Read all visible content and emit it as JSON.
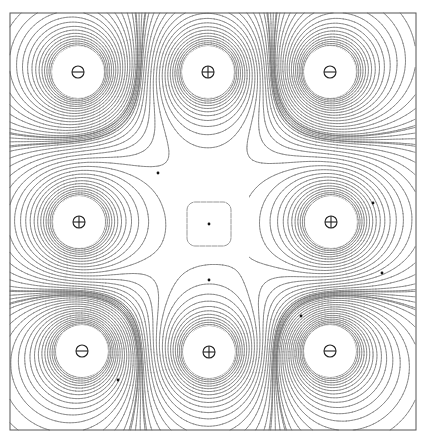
{
  "figure": {
    "type": "equipotential-contour-plot",
    "frame": {
      "x0": 10,
      "y0": 13,
      "x1": 416,
      "y1": 430
    },
    "charges": [
      {
        "id": "q1",
        "sign": "negative",
        "symbol": "⊖",
        "x": 78,
        "y": 72,
        "q": -1
      },
      {
        "id": "q2",
        "sign": "positive",
        "symbol": "⊕",
        "x": 208,
        "y": 72,
        "q": 1
      },
      {
        "id": "q3",
        "sign": "negative",
        "symbol": "⊖",
        "x": 330,
        "y": 72,
        "q": -1
      },
      {
        "id": "q4",
        "sign": "positive",
        "symbol": "⊕",
        "x": 79,
        "y": 222,
        "q": 1
      },
      {
        "id": "q5",
        "sign": "positive",
        "symbol": "⊕",
        "x": 331,
        "y": 222,
        "q": 1
      },
      {
        "id": "q6",
        "sign": "negative",
        "symbol": "⊖",
        "x": 82,
        "y": 351,
        "q": -1
      },
      {
        "id": "q7",
        "sign": "positive",
        "symbol": "⊕",
        "x": 209,
        "y": 352,
        "q": 1
      },
      {
        "id": "q8",
        "sign": "negative",
        "symbol": "⊖",
        "x": 330,
        "y": 351,
        "q": -1
      }
    ],
    "center_contour": {
      "x": 209,
      "y": 224,
      "half_size": 22,
      "corner_radius": 8
    },
    "markers": [
      {
        "x": 158,
        "y": 173
      },
      {
        "x": 209,
        "y": 224
      },
      {
        "x": 209,
        "y": 280
      },
      {
        "x": 373,
        "y": 203
      },
      {
        "x": 382,
        "y": 273
      },
      {
        "x": 301,
        "y": 316
      },
      {
        "x": 118,
        "y": 380
      }
    ],
    "charge_symbol_radius": 6,
    "cleared_radius": 26,
    "contour_levels": 26,
    "line_color": "#6a6a6a"
  }
}
